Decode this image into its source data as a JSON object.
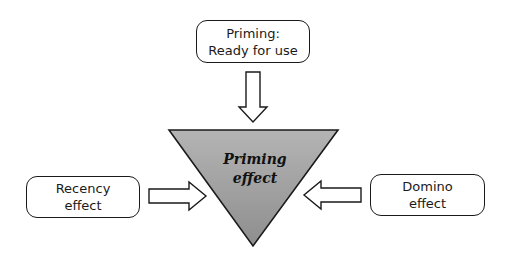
{
  "diagram": {
    "center": {
      "shape": "inverted-triangle",
      "label_lines": [
        "Priming",
        "effect"
      ],
      "fill_color": "#a8a8a8",
      "stroke_color": "#1a1a1a"
    },
    "top_node": {
      "label_lines": [
        "Priming:",
        "Ready for use"
      ],
      "arrow_direction": "down"
    },
    "left_node": {
      "label_lines": [
        "Recency",
        "effect"
      ],
      "arrow_direction": "right"
    },
    "right_node": {
      "label_lines": [
        "Domino",
        "effect"
      ],
      "arrow_direction": "left"
    }
  }
}
